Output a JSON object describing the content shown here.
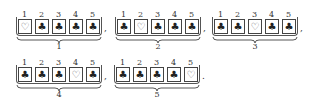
{
  "groups": [
    {
      "label": "1",
      "positions": [
        "1",
        "2",
        "3",
        "4",
        "5"
      ],
      "cards": [
        "♡",
        "♣",
        "♣",
        "♣",
        "♣"
      ],
      "heart_index": 0,
      "punct": ","
    },
    {
      "label": "2",
      "positions": [
        "1",
        "2",
        "3",
        "4",
        "5"
      ],
      "cards": [
        "♣",
        "♡",
        "♣",
        "♣",
        "♣"
      ],
      "heart_index": 1,
      "punct": ","
    },
    {
      "label": "3",
      "positions": [
        "1",
        "2",
        "3",
        "4",
        "5"
      ],
      "cards": [
        "♣",
        "♣",
        "♡",
        "♣",
        "♣"
      ],
      "heart_index": 2,
      "punct": ","
    },
    {
      "label": "4",
      "positions": [
        "1",
        "2",
        "3",
        "4",
        "5"
      ],
      "cards": [
        "♣",
        "♣",
        "♣",
        "♡",
        "♣"
      ],
      "heart_index": 3,
      "punct": ","
    },
    {
      "label": "5",
      "positions": [
        "1",
        "2",
        "3",
        "4",
        "5"
      ],
      "cards": [
        "♣",
        "♣",
        "♣",
        "♣",
        "♡"
      ],
      "heart_index": 4,
      "punct": "."
    }
  ],
  "icons": {
    "heart": "heart-outline-icon",
    "club": "club-filled-icon"
  },
  "colors": {
    "border": "#444444",
    "text": "#222222",
    "background": "#ffffff"
  }
}
